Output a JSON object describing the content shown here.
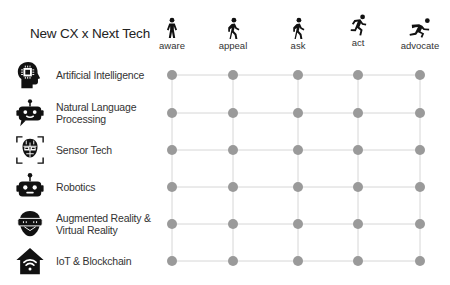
{
  "title": "New CX x Next Tech",
  "stages": [
    {
      "label": "aware",
      "icon": "standing-person-icon",
      "x": 172
    },
    {
      "label": "appeal",
      "icon": "walking-person-icon",
      "x": 233
    },
    {
      "label": "ask",
      "icon": "walking-person-icon",
      "x": 298
    },
    {
      "label": "act",
      "icon": "running-person-icon",
      "x": 358
    },
    {
      "label": "advocate",
      "icon": "sprinting-person-icon",
      "x": 420
    }
  ],
  "technologies": [
    {
      "label": "Artificial Intelligence",
      "icon": "ai-head-chip-icon",
      "y": 75
    },
    {
      "label": "Natural Language Processing",
      "icon": "chatbot-icon",
      "y": 113
    },
    {
      "label": "Sensor Tech",
      "icon": "face-scan-icon",
      "y": 150
    },
    {
      "label": "Robotics",
      "icon": "robot-head-icon",
      "y": 187
    },
    {
      "label": "Augmented Reality & Virtual Reality",
      "icon": "vr-headset-icon",
      "y": 224
    },
    {
      "label": "IoT & Blockchain",
      "icon": "smart-home-wifi-icon",
      "y": 261
    }
  ],
  "colors": {
    "dot": "#9a9a9a",
    "line": "#d6d6d6",
    "icon": "#111111"
  }
}
